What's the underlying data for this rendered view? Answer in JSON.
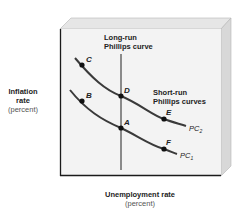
{
  "diagram": {
    "y_axis": {
      "label": "Inflation rate",
      "label_line1": "Inflation",
      "label_line2": "rate",
      "unit": "(percent)"
    },
    "x_axis": {
      "label": "Unemployment rate",
      "unit": "(percent)"
    },
    "long_run": {
      "label_line1": "Long-run",
      "label_line2": "Phillips curve"
    },
    "short_run": {
      "label_line1": "Short-run",
      "label_line2": "Phillips curves"
    },
    "curves": [
      {
        "id": "PC2",
        "label": "PC",
        "subscript": "2",
        "points": [
          "C",
          "D",
          "E"
        ]
      },
      {
        "id": "PC1",
        "label": "PC",
        "subscript": "1",
        "points": [
          "B",
          "A",
          "F"
        ]
      }
    ],
    "points": [
      {
        "name": "C",
        "curve": "PC2"
      },
      {
        "name": "D",
        "curve": "PC2",
        "on_long_run": true
      },
      {
        "name": "E",
        "curve": "PC2"
      },
      {
        "name": "B",
        "curve": "PC1"
      },
      {
        "name": "A",
        "curve": "PC1",
        "on_long_run": true
      },
      {
        "name": "F",
        "curve": "PC1"
      }
    ],
    "colors": {
      "curve": "#3a3a3a",
      "long_run_line": "#8a8a8a",
      "face": "#f2f2f2",
      "bevel_top": "#e4e4e4",
      "bevel_side": "#d6d6d6",
      "border": "#1a1a1a"
    }
  }
}
